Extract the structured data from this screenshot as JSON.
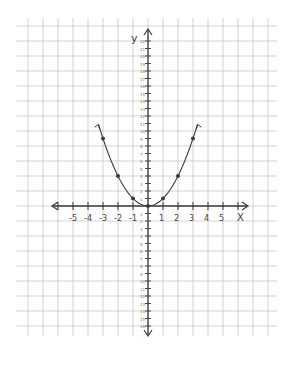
{
  "chart_data": {
    "type": "line",
    "title": "",
    "equation": "y = x^2",
    "xlabel": "X",
    "ylabel": "y",
    "x_tick_labels": [
      "-5",
      "-4",
      "-3",
      "-2",
      "-1",
      "0",
      "1",
      "2",
      "3",
      "4",
      "5"
    ],
    "x": [
      -3,
      -2,
      -1,
      0,
      1,
      2,
      3
    ],
    "series": [
      {
        "name": "y = x^2",
        "x": [
          -3,
          -2,
          -1,
          0,
          1,
          2,
          3
        ],
        "values": [
          9,
          4,
          1,
          0,
          1,
          4,
          9
        ]
      }
    ],
    "xlim": [
      -6.5,
      6.5
    ],
    "ylim": [
      -18,
      18
    ],
    "grid": true,
    "legend": "none",
    "end_arrows": true,
    "colors": {
      "grid": "#c8c8c8",
      "ink": "#3a3a3a",
      "paper": "#ffffff"
    }
  },
  "labels": {
    "x_axis": "X",
    "y_axis": "y",
    "x_ticks": [
      "-5",
      "-4",
      "-3",
      "-2",
      "-1",
      "1",
      "2",
      "3",
      "4",
      "5"
    ]
  }
}
